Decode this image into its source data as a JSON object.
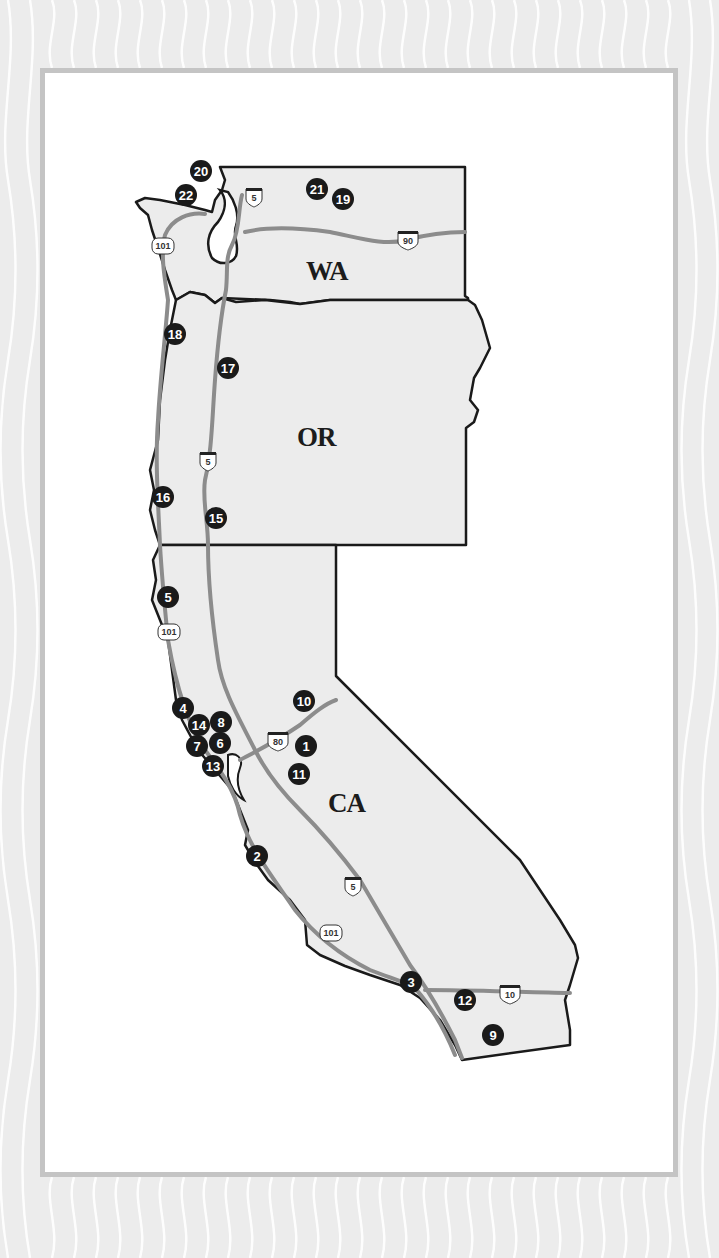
{
  "map": {
    "colors": {
      "background": "#ececec",
      "wave_lines": "#ffffff",
      "frame_border": "#c4c4c4",
      "panel": "#ffffff",
      "state_fill": "#ececec",
      "state_border": "#1a1a1a",
      "road": "#8c8c8c",
      "marker_fill": "#1a1a1a",
      "marker_text": "#ffffff"
    },
    "states": [
      {
        "id": "WA",
        "label": "WA"
      },
      {
        "id": "OR",
        "label": "OR"
      },
      {
        "id": "CA",
        "label": "CA"
      }
    ],
    "highways": [
      {
        "id": "i5-wa",
        "type": "interstate",
        "number": "5"
      },
      {
        "id": "i90",
        "type": "interstate",
        "number": "90"
      },
      {
        "id": "us101-wa",
        "type": "us",
        "number": "101"
      },
      {
        "id": "i5-or",
        "type": "interstate",
        "number": "5"
      },
      {
        "id": "us101-ca-north",
        "type": "us",
        "number": "101"
      },
      {
        "id": "i80",
        "type": "interstate",
        "number": "80"
      },
      {
        "id": "i5-ca",
        "type": "interstate",
        "number": "5"
      },
      {
        "id": "us101-ca-south",
        "type": "us",
        "number": "101"
      },
      {
        "id": "i10",
        "type": "interstate",
        "number": "10"
      }
    ],
    "markers": [
      {
        "number": "1",
        "state": "CA"
      },
      {
        "number": "2",
        "state": "CA"
      },
      {
        "number": "3",
        "state": "CA"
      },
      {
        "number": "4",
        "state": "CA"
      },
      {
        "number": "5",
        "state": "CA"
      },
      {
        "number": "6",
        "state": "CA"
      },
      {
        "number": "7",
        "state": "CA"
      },
      {
        "number": "8",
        "state": "CA"
      },
      {
        "number": "9",
        "state": "CA"
      },
      {
        "number": "10",
        "state": "CA"
      },
      {
        "number": "11",
        "state": "CA"
      },
      {
        "number": "12",
        "state": "CA"
      },
      {
        "number": "13",
        "state": "CA"
      },
      {
        "number": "14",
        "state": "CA"
      },
      {
        "number": "15",
        "state": "OR"
      },
      {
        "number": "16",
        "state": "OR"
      },
      {
        "number": "17",
        "state": "OR"
      },
      {
        "number": "18",
        "state": "OR"
      },
      {
        "number": "19",
        "state": "WA"
      },
      {
        "number": "20",
        "state": "WA"
      },
      {
        "number": "21",
        "state": "WA"
      },
      {
        "number": "22",
        "state": "WA"
      }
    ]
  }
}
